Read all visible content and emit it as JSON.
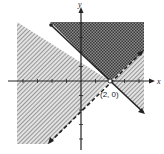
{
  "diagram": {
    "type": "linear-inequality-graph",
    "axes": {
      "x_label": "x",
      "y_label": "y",
      "origin_px": [
        81,
        81
      ],
      "unit_px": 14.5,
      "x_ticks": [
        -4,
        -3,
        -2,
        -1,
        1,
        2,
        3,
        4
      ],
      "y_ticks": [
        -4,
        -3,
        -2,
        -1,
        1,
        2,
        3,
        4
      ]
    },
    "lines": [
      {
        "name": "boundary-solid",
        "equation": "x + y = 2",
        "style": "solid"
      },
      {
        "name": "boundary-dashed",
        "equation": "y = x - 2",
        "style": "dashed"
      }
    ],
    "point": {
      "label": "(2, 0)",
      "x": 2,
      "y": 0,
      "style": "open-circle"
    },
    "regions": {
      "overlap": "dark crosshatch (solution region)",
      "single": "diagonal hatch"
    },
    "colors": {
      "line": "#222222",
      "hatch": "#7a7a7a",
      "overlap": "#5c5c5c",
      "background": "#ffffff"
    }
  }
}
